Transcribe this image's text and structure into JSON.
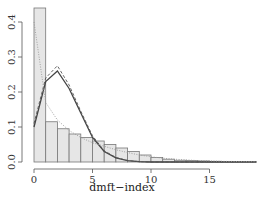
{
  "chart_data": {
    "type": "bar",
    "title": "",
    "xlabel": "dmft−index",
    "ylabel": "",
    "xlim": [
      0,
      19
    ],
    "ylim": [
      0,
      0.44
    ],
    "grid": false,
    "legend": null,
    "x_ticks": [
      "0",
      "5",
      "10",
      "15"
    ],
    "y_ticks": [
      "0.0",
      "0.1",
      "0.2",
      "0.3",
      "0.4"
    ],
    "histogram": {
      "bin_edges": [
        0,
        1,
        2,
        3,
        4,
        5,
        6,
        7,
        8,
        9,
        10,
        11,
        12,
        13,
        14,
        15,
        16,
        17,
        18,
        19
      ],
      "values": [
        0.44,
        0.115,
        0.095,
        0.08,
        0.07,
        0.06,
        0.05,
        0.04,
        0.03,
        0.02,
        0.013,
        0.008,
        0.005,
        0.004,
        0.003,
        0.002,
        0.001,
        0.001,
        0.0005
      ],
      "fill": "#e6e6e6",
      "stroke": "#777777"
    },
    "series": [
      {
        "name": "fitted-solid",
        "style": "solid",
        "color": "#444444",
        "x": [
          0,
          1,
          2,
          3,
          4,
          5,
          6,
          7,
          8,
          9,
          10,
          11,
          12,
          13,
          14,
          15,
          16,
          17,
          18,
          19
        ],
        "values": [
          0.1,
          0.23,
          0.26,
          0.21,
          0.14,
          0.07,
          0.03,
          0.012,
          0.004,
          0.001,
          0,
          0,
          0,
          0,
          0,
          0,
          0,
          0,
          0,
          0
        ]
      },
      {
        "name": "fitted-dashed",
        "style": "dashed",
        "color": "#555555",
        "x": [
          0,
          1,
          2,
          3,
          4,
          5,
          6,
          7,
          8,
          9,
          10,
          11,
          12,
          13,
          14,
          15,
          16,
          17,
          18,
          19
        ],
        "values": [
          0.11,
          0.24,
          0.275,
          0.22,
          0.145,
          0.075,
          0.032,
          0.013,
          0.004,
          0.001,
          0,
          0,
          0,
          0,
          0,
          0,
          0,
          0,
          0,
          0
        ]
      },
      {
        "name": "fitted-dotted",
        "style": "dotted",
        "color": "#999999",
        "x": [
          0,
          1,
          2,
          3,
          4,
          5,
          6,
          7,
          8,
          9,
          10,
          11,
          12,
          13,
          14,
          15,
          16,
          17,
          18,
          19
        ],
        "values": [
          0.4,
          0.17,
          0.12,
          0.09,
          0.07,
          0.055,
          0.045,
          0.035,
          0.027,
          0.02,
          0.015,
          0.011,
          0.008,
          0.006,
          0.004,
          0.003,
          0.002,
          0.0015,
          0.001,
          0.0008
        ]
      }
    ]
  }
}
